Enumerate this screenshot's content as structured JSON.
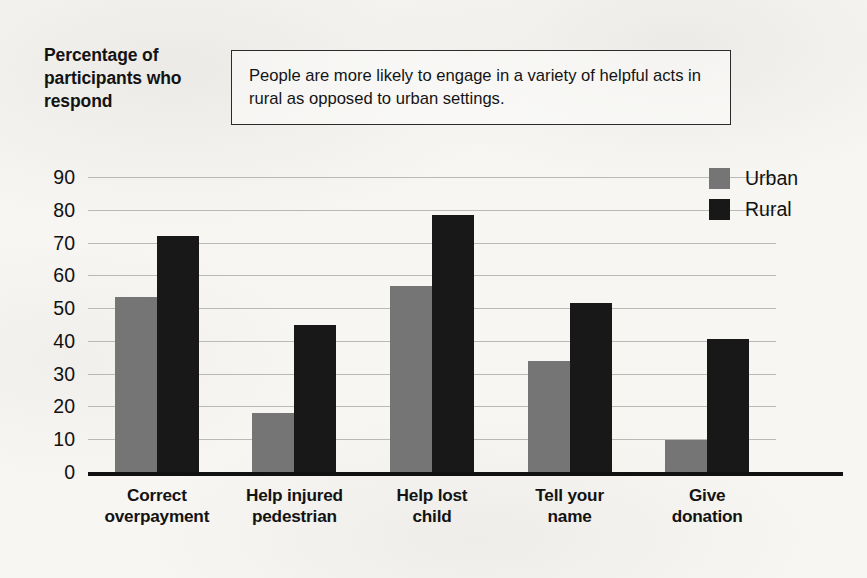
{
  "chart_data": {
    "type": "bar",
    "title": "",
    "caption": "People are more likely to engage in a variety of helpful acts in rural as opposed to urban settings.",
    "ylabel": "Percentage of participants who respond",
    "xlabel": "",
    "categories": [
      "Correct overpayment",
      "Help injured pedestrian",
      "Help lost child",
      "Tell your name",
      "Give donation"
    ],
    "category_lines": [
      [
        "Correct",
        "overpayment"
      ],
      [
        "Help injured",
        "pedestrian"
      ],
      [
        "Help lost",
        "child"
      ],
      [
        "Tell your",
        "name"
      ],
      [
        "Give",
        "donation"
      ]
    ],
    "series": [
      {
        "name": "Urban",
        "color": "#757575",
        "values": [
          53.5,
          18,
          56.7,
          33.8,
          9.8
        ]
      },
      {
        "name": "Rural",
        "color": "#181818",
        "values": [
          72,
          44.7,
          78.4,
          51.5,
          40.5
        ]
      }
    ],
    "ylim": [
      0,
      90
    ],
    "yticks": [
      90,
      80,
      70,
      60,
      50,
      40,
      30,
      20,
      10,
      0
    ],
    "ytick_labels": [
      "90",
      "80",
      "70",
      "60",
      "50",
      "40",
      "30",
      "20",
      "10",
      "0"
    ],
    "grid": true,
    "legend_position": "top-right",
    "legend": [
      "Urban",
      "Rural"
    ]
  },
  "colors": {
    "urban": "#757575",
    "rural": "#181818",
    "gridline": "#b9b9b9",
    "axis": "#111111",
    "background": "#f7f6f3",
    "caption_border": "#2b2b2b"
  }
}
